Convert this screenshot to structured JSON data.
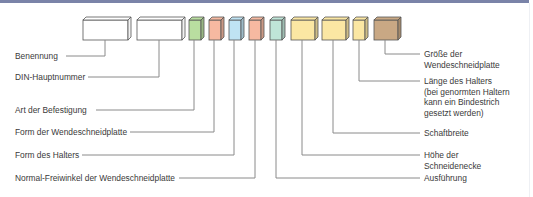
{
  "diagram": {
    "boxes": [
      {
        "id": "benennung",
        "color": "#ffffff"
      },
      {
        "id": "din-hauptnummer",
        "color": "#ffffff"
      },
      {
        "id": "art-der-befestigung",
        "color": "#b9dea0"
      },
      {
        "id": "form-der-wendeschneidplatte",
        "color": "#f6b9a1"
      },
      {
        "id": "form-des-halters",
        "color": "#bfe3f3"
      },
      {
        "id": "normal-freiwinkel",
        "color": "#f6b9a1"
      },
      {
        "id": "ausfuehrung",
        "color": "#bfe5d8"
      },
      {
        "id": "hoehe-der-schneidenecke",
        "color": "#fbe7a3"
      },
      {
        "id": "schaftbreite",
        "color": "#fbe7a3"
      },
      {
        "id": "laenge-des-halters",
        "color": "#fbe7a3"
      },
      {
        "id": "groesse-der-wendeschneidplatte",
        "color": "#c9a884"
      }
    ],
    "left_labels": [
      "Benennung",
      "DIN-Hauptnummer",
      "Art der Befestigung",
      "Form der Wendeschneidplatte",
      "Form des Halters",
      "Normal-Freiwinkel der Wendeschneidplatte"
    ],
    "right_labels": [
      [
        "Größe der",
        "Wendeschneidplatte"
      ],
      [
        "Länge des Halters",
        "(bei genormten Haltern",
        "kann ein Bindestrich",
        "gesetzt werden)"
      ],
      [
        "Schaftbreite"
      ],
      [
        "Höhe der",
        "Schneidenecke"
      ],
      [
        "Ausführung"
      ]
    ]
  }
}
